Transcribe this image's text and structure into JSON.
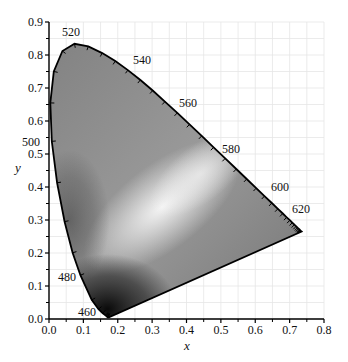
{
  "chart_data": {
    "type": "line",
    "title": "",
    "subtitle": "CIE 1931 chromaticity diagram (spectral locus, grayscale)",
    "xlabel": "x",
    "ylabel": "y",
    "xlim": [
      0.0,
      0.8
    ],
    "ylim": [
      0.0,
      0.9
    ],
    "x_ticks": [
      "0.0",
      "0.1",
      "0.2",
      "0.3",
      "0.4",
      "0.5",
      "0.6",
      "0.7",
      "0.8"
    ],
    "y_ticks": [
      "0.0",
      "0.1",
      "0.2",
      "0.3",
      "0.4",
      "0.5",
      "0.6",
      "0.7",
      "0.8",
      "0.9"
    ],
    "grid": true,
    "legend": null,
    "wavelength_labels": [
      {
        "nm": "460",
        "x": 0.144,
        "y": 0.03
      },
      {
        "nm": "480",
        "x": 0.091,
        "y": 0.133
      },
      {
        "nm": "500",
        "x": 0.008,
        "y": 0.538
      },
      {
        "nm": "520",
        "x": 0.074,
        "y": 0.834
      },
      {
        "nm": "540",
        "x": 0.23,
        "y": 0.754
      },
      {
        "nm": "560",
        "x": 0.373,
        "y": 0.624
      },
      {
        "nm": "580",
        "x": 0.512,
        "y": 0.487
      },
      {
        "nm": "600",
        "x": 0.627,
        "y": 0.373
      },
      {
        "nm": "620",
        "x": 0.691,
        "y": 0.308
      }
    ],
    "series": [
      {
        "name": "spectral locus",
        "x": [
          0.1741,
          0.174,
          0.1738,
          0.1733,
          0.1726,
          0.1714,
          0.1689,
          0.1644,
          0.1566,
          0.144,
          0.1241,
          0.0913,
          0.0687,
          0.0454,
          0.0235,
          0.0082,
          0.0039,
          0.0139,
          0.0389,
          0.0743,
          0.1142,
          0.1547,
          0.1929,
          0.2296,
          0.2658,
          0.3016,
          0.3373,
          0.3731,
          0.4087,
          0.4441,
          0.4788,
          0.5125,
          0.5448,
          0.5752,
          0.6029,
          0.627,
          0.6482,
          0.6658,
          0.6801,
          0.6915,
          0.7006,
          0.7079,
          0.714,
          0.719,
          0.723,
          0.726,
          0.7283,
          0.73,
          0.7311,
          0.732,
          0.7347
        ],
        "y": [
          0.005,
          0.005,
          0.0049,
          0.0048,
          0.0048,
          0.0051,
          0.0069,
          0.0109,
          0.0177,
          0.0297,
          0.0578,
          0.1327,
          0.2007,
          0.295,
          0.4127,
          0.5384,
          0.6548,
          0.7502,
          0.812,
          0.8338,
          0.8262,
          0.8059,
          0.7816,
          0.7543,
          0.7243,
          0.6923,
          0.6589,
          0.6245,
          0.5896,
          0.5547,
          0.5202,
          0.4866,
          0.4544,
          0.4242,
          0.3965,
          0.3725,
          0.3514,
          0.334,
          0.3197,
          0.3083,
          0.2993,
          0.292,
          0.2859,
          0.2809,
          0.277,
          0.274,
          0.2717,
          0.27,
          0.2689,
          0.268,
          0.2653
        ],
        "wavelengths_nm": [
          380,
          390,
          400,
          410,
          420,
          430,
          440,
          450,
          455,
          460,
          470,
          480,
          485,
          490,
          495,
          500,
          505,
          510,
          515,
          520,
          525,
          530,
          535,
          540,
          545,
          550,
          555,
          560,
          565,
          570,
          575,
          580,
          585,
          590,
          595,
          600,
          605,
          610,
          615,
          620,
          625,
          630,
          635,
          640,
          645,
          650,
          655,
          660,
          665,
          670,
          700
        ]
      }
    ],
    "fill": {
      "description": "grayscale gradient inside gamut: light near (0.33,0.33) white point, dark near blue corner (0.16,0.02)",
      "dark": "#111111",
      "light": "#f2f2f2",
      "mid": "#8a8a8a"
    }
  },
  "axes": {
    "x_title": "x",
    "y_title": "y"
  }
}
